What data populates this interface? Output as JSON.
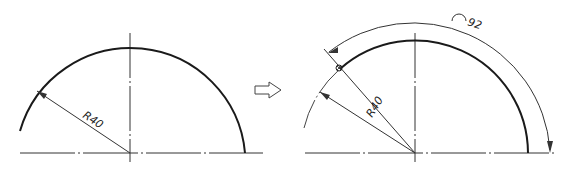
{
  "diagram": {
    "type": "technical-drawing",
    "left_figure": {
      "radius_label": "R40",
      "shape": "semicircle-arc"
    },
    "transition_arrow": "hollow-right-arrow",
    "right_figure": {
      "radius_label": "R40",
      "arc_length_label": "92",
      "arc_length_symbol": "arc-symbol",
      "shape": "semicircle-arc-with-arc-length-dimension"
    },
    "colors": {
      "line": "#1a1a1a",
      "thin_line": "#444444",
      "background": "#ffffff"
    }
  }
}
